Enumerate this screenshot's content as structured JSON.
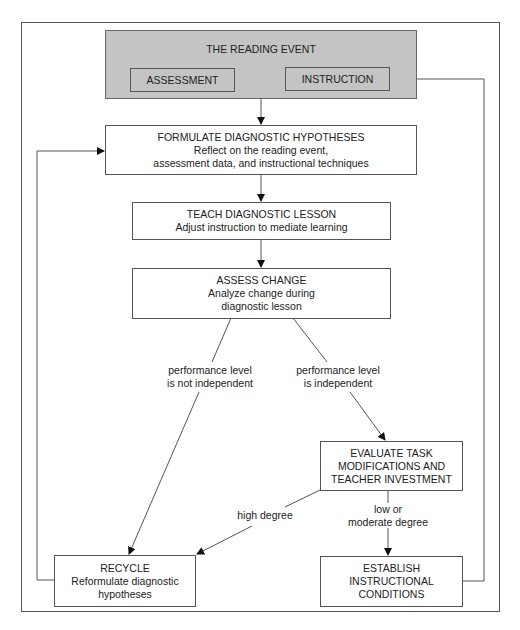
{
  "diagram": {
    "reading_event": {
      "title": "THE READING EVENT",
      "assessment": "ASSESSMENT",
      "instruction": "INSTRUCTION"
    },
    "formulate": {
      "title": "FORMULATE DIAGNOSTIC HYPOTHESES",
      "line1": "Reflect on the reading event,",
      "line2": "assessment data, and instructional techniques"
    },
    "teach": {
      "title": "TEACH DIAGNOSTIC LESSON",
      "line1": "Adjust instruction to mediate learning"
    },
    "assess_change": {
      "title": "ASSESS CHANGE",
      "line1": "Analyze change during",
      "line2": "diagnostic lesson"
    },
    "branch_not_independent": {
      "line1": "performance level",
      "line2": "is not independent"
    },
    "branch_independent": {
      "line1": "performance level",
      "line2": "is independent"
    },
    "evaluate": {
      "line1": "EVALUATE TASK",
      "line2": "MODIFICATIONS AND",
      "line3": "TEACHER INVESTMENT"
    },
    "high_degree": "high degree",
    "low_moderate": {
      "line1": "low or",
      "line2": "moderate degree"
    },
    "recycle": {
      "title": "RECYCLE",
      "line1": "Reformulate diagnostic",
      "line2": "hypotheses"
    },
    "establish": {
      "line1": "ESTABLISH",
      "line2": "INSTRUCTIONAL",
      "line3": "CONDITIONS"
    }
  },
  "colors": {
    "event_fill": "#c4c4c4",
    "stroke": "#555555"
  }
}
